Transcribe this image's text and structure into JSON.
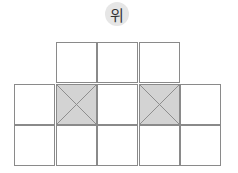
{
  "label": {
    "text": "위",
    "meaning": "top"
  },
  "grid": {
    "cell_size": 41.5,
    "shaded_color": "#d3d3d3",
    "line_color": "#8a8a8a",
    "rows": [
      {
        "cols": [
          1,
          2,
          3
        ],
        "shaded": []
      },
      {
        "cols": [
          0,
          1,
          2,
          3,
          4
        ],
        "shaded": [
          1,
          3
        ]
      },
      {
        "cols": [
          0,
          1,
          2,
          3,
          4
        ],
        "shaded": []
      }
    ]
  }
}
